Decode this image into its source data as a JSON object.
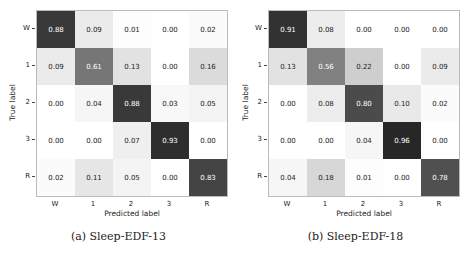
{
  "chart_data": [
    {
      "type": "heatmap",
      "title": "(a) Sleep-EDF-13",
      "xlabel": "Predicted label",
      "ylabel": "True label",
      "x_categories": [
        "W",
        "1",
        "2",
        "3",
        "R"
      ],
      "y_categories": [
        "W",
        "1",
        "2",
        "3",
        "R"
      ],
      "values": [
        [
          0.88,
          0.09,
          0.01,
          0.0,
          0.02
        ],
        [
          0.09,
          0.61,
          0.13,
          0.0,
          0.16
        ],
        [
          0.0,
          0.04,
          0.88,
          0.03,
          0.05
        ],
        [
          0.0,
          0.0,
          0.07,
          0.93,
          0.0
        ],
        [
          0.02,
          0.11,
          0.05,
          0.0,
          0.83
        ]
      ],
      "colormap": "greys"
    },
    {
      "type": "heatmap",
      "title": "(b) Sleep-EDF-18",
      "xlabel": "Predicted label",
      "ylabel": "True label",
      "x_categories": [
        "W",
        "1",
        "2",
        "3",
        "R"
      ],
      "y_categories": [
        "W",
        "1",
        "2",
        "3",
        "R"
      ],
      "values": [
        [
          0.91,
          0.08,
          0.0,
          0.0,
          0.0
        ],
        [
          0.13,
          0.56,
          0.22,
          0.0,
          0.09
        ],
        [
          0.0,
          0.08,
          0.8,
          0.1,
          0.02
        ],
        [
          0.0,
          0.0,
          0.04,
          0.96,
          0.0
        ],
        [
          0.04,
          0.18,
          0.01,
          0.0,
          0.78
        ]
      ],
      "colormap": "greys"
    }
  ],
  "panels": [
    {
      "caption": "(a) Sleep-EDF-13",
      "xlabel": "Predicted label",
      "ylabel": "True label"
    },
    {
      "caption": "(b) Sleep-EDF-18",
      "xlabel": "Predicted label",
      "ylabel": "True label"
    }
  ]
}
